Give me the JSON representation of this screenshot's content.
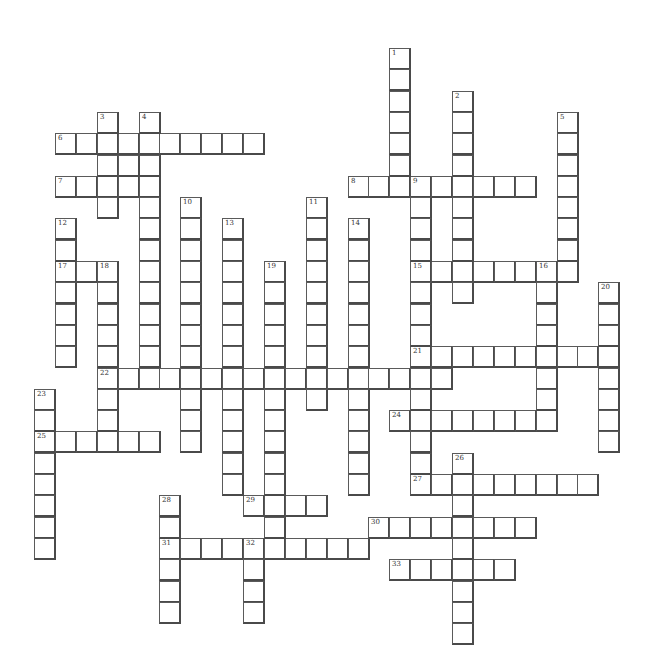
{
  "puzzle": {
    "type": "crossword",
    "layout": {
      "origin_x": 34,
      "origin_y": 48,
      "cell_w": 20.9,
      "cell_h": 21.3
    },
    "colors": {
      "cell_bg": "#ffffff",
      "cell_border": "#4a4a4a",
      "number": "#333333"
    },
    "across": [
      {
        "number": 6,
        "row": 4,
        "col": 1,
        "length": 10
      },
      {
        "number": 7,
        "row": 6,
        "col": 1,
        "length": 5
      },
      {
        "number": 8,
        "row": 6,
        "col": 15,
        "length": 9
      },
      {
        "number": 15,
        "row": 10,
        "col": 18,
        "length": 8
      },
      {
        "number": 17,
        "row": 10,
        "col": 1,
        "length": 3
      },
      {
        "number": 21,
        "row": 14,
        "col": 18,
        "length": 10
      },
      {
        "number": 22,
        "row": 15,
        "col": 3,
        "length": 17
      },
      {
        "number": 24,
        "row": 17,
        "col": 17,
        "length": 8
      },
      {
        "number": 25,
        "row": 18,
        "col": 0,
        "length": 6
      },
      {
        "number": 27,
        "row": 20,
        "col": 18,
        "length": 9
      },
      {
        "number": 29,
        "row": 21,
        "col": 10,
        "length": 4
      },
      {
        "number": 30,
        "row": 22,
        "col": 16,
        "length": 8
      },
      {
        "number": 31,
        "row": 23,
        "col": 6,
        "length": 10
      },
      {
        "number": 33,
        "row": 24,
        "col": 17,
        "length": 6
      }
    ],
    "down": [
      {
        "number": 1,
        "row": 0,
        "col": 17,
        "length": 7
      },
      {
        "number": 2,
        "row": 2,
        "col": 20,
        "length": 10
      },
      {
        "number": 3,
        "row": 3,
        "col": 3,
        "length": 5
      },
      {
        "number": 4,
        "row": 3,
        "col": 5,
        "length": 13
      },
      {
        "number": 5,
        "row": 3,
        "col": 25,
        "length": 8
      },
      {
        "number": 9,
        "row": 6,
        "col": 18,
        "length": 15
      },
      {
        "number": 10,
        "row": 7,
        "col": 7,
        "length": 12
      },
      {
        "number": 11,
        "row": 7,
        "col": 13,
        "length": 10
      },
      {
        "number": 12,
        "row": 8,
        "col": 1,
        "length": 7
      },
      {
        "number": 13,
        "row": 8,
        "col": 9,
        "length": 13
      },
      {
        "number": 14,
        "row": 8,
        "col": 15,
        "length": 13
      },
      {
        "number": 16,
        "row": 10,
        "col": 24,
        "length": 7
      },
      {
        "number": 18,
        "row": 10,
        "col": 3,
        "length": 9
      },
      {
        "number": 19,
        "row": 10,
        "col": 11,
        "length": 14
      },
      {
        "number": 20,
        "row": 11,
        "col": 27,
        "length": 8
      },
      {
        "number": 23,
        "row": 16,
        "col": 0,
        "length": 8
      },
      {
        "number": 26,
        "row": 19,
        "col": 20,
        "length": 9
      },
      {
        "number": 28,
        "row": 21,
        "col": 6,
        "length": 6
      },
      {
        "number": 32,
        "row": 23,
        "col": 10,
        "length": 4
      }
    ],
    "extra_cells": [
      {
        "row": 5,
        "col": 4
      }
    ]
  }
}
